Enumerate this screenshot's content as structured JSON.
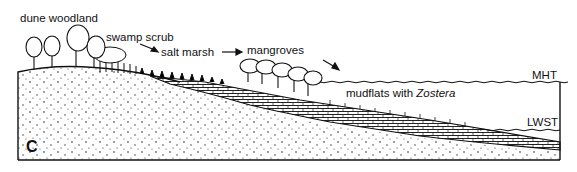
{
  "diagram": {
    "panel_label": "C",
    "labels": {
      "dune_woodland": "dune woodland",
      "swamp_scrub": "swamp scrub",
      "salt_marsh": "salt marsh",
      "mangroves": "mangroves",
      "mudflats_prefix": "mudflats with ",
      "mudflats_taxon": "Zostera",
      "mht": "MHT",
      "lwst": "LWST"
    },
    "colors": {
      "ink": "#111111",
      "background": "#ffffff"
    }
  }
}
